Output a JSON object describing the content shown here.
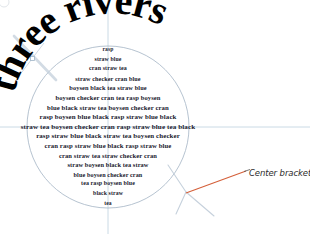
{
  "document": {
    "headline": "three rivers",
    "headline_style": "curved-arc-serif-bold",
    "shape": "circle"
  },
  "poem": {
    "lines": [
      "rasp",
      "straw blue",
      "cran straw tea",
      "straw checker cran  blue",
      "boysen black tea  straw blue",
      "boysen checker cran tea rasp boysen",
      "blue black straw tea boysen checker cran",
      "rasp boysen blue black rasp straw blue black",
      "straw tea boysen checker cran rasp straw blue tea black",
      "rasp straw blue black straw tea boysen checker",
      "cran rasp straw blue black rasp straw blue",
      "cran straw tea straw checker cran",
      "straw boysen black tea  straw",
      "blue boysen checker cran",
      "tea rasp boysen blue",
      "black straw",
      "tea"
    ]
  },
  "annotations": {
    "center_bracket_label": "Center bracket"
  },
  "colors": {
    "leader_line": "#d4603a",
    "guide": "#b9c6d4",
    "circle_outline": "#aebccb",
    "text": "#1a1a2e",
    "headline": "#000000",
    "label_text": "#2b2b2b",
    "background": "#ffffff"
  }
}
